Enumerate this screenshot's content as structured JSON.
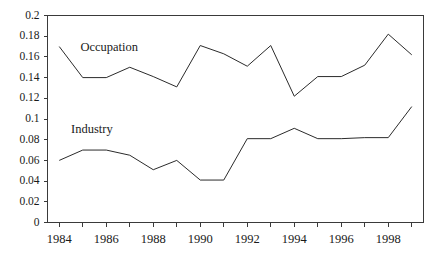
{
  "chart_data": {
    "type": "line",
    "title": "",
    "subtitle": "",
    "xlabel": "",
    "ylabel": "",
    "x": [
      1984,
      1985,
      1986,
      1987,
      1988,
      1989,
      1990,
      1991,
      1992,
      1993,
      1994,
      1995,
      1996,
      1997,
      1998,
      1999
    ],
    "categories": [
      "1984",
      "1985",
      "1986",
      "1987",
      "1988",
      "1989",
      "1990",
      "1991",
      "1992",
      "1993",
      "1994",
      "1995",
      "1996",
      "1997",
      "1998",
      "1999"
    ],
    "series": [
      {
        "name": "Occupation",
        "color": "#2b2b2b",
        "values": [
          0.17,
          0.14,
          0.14,
          0.15,
          0.141,
          0.131,
          0.171,
          0.163,
          0.151,
          0.171,
          0.122,
          0.141,
          0.141,
          0.152,
          0.182,
          0.162
        ],
        "label_text": "Occupation",
        "label_x": 1984.9,
        "label_y": 0.1655
      },
      {
        "name": "Industry",
        "color": "#2b2b2b",
        "values": [
          0.06,
          0.07,
          0.07,
          0.065,
          0.051,
          0.06,
          0.041,
          0.041,
          0.081,
          0.081,
          0.091,
          0.081,
          0.081,
          0.082,
          0.082,
          0.112
        ],
        "label_text": "Industry",
        "label_x": 1984.5,
        "label_y": 0.0865
      }
    ],
    "xlim": [
      1983.5,
      1999.5
    ],
    "ylim": [
      0,
      0.2
    ],
    "xticks": [
      1984,
      1985,
      1986,
      1987,
      1988,
      1989,
      1990,
      1991,
      1992,
      1993,
      1994,
      1995,
      1996,
      1997,
      1998,
      1999
    ],
    "xtick_labels_shown": [
      {
        "value": 1984,
        "label": "1984"
      },
      {
        "value": 1986,
        "label": "1986"
      },
      {
        "value": 1988,
        "label": "1988"
      },
      {
        "value": 1990,
        "label": "1990"
      },
      {
        "value": 1992,
        "label": "1992"
      },
      {
        "value": 1994,
        "label": "1994"
      },
      {
        "value": 1996,
        "label": "1996"
      },
      {
        "value": 1998,
        "label": "1998"
      }
    ],
    "yticks": [
      0,
      0.02,
      0.04,
      0.06,
      0.08,
      0.1,
      0.12,
      0.14,
      0.16,
      0.18,
      0.2
    ],
    "ytick_labels": [
      "0",
      "0.02",
      "0.04",
      "0.06",
      "0.08",
      "0.1",
      "0.12",
      "0.14",
      "0.16",
      "0.18",
      "0.2"
    ],
    "grid": false,
    "legend_position": "inline-annotation",
    "plot_border": [
      "left",
      "bottom",
      "top",
      "right"
    ],
    "background_color": "#ffffff",
    "axis_color": "#3a3a3a",
    "line_color": "#2b2b2b"
  }
}
